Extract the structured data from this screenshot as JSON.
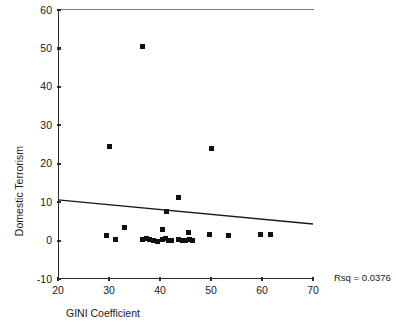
{
  "chart_data": {
    "type": "scatter",
    "title": "",
    "xlabel": "GINI Coefficient",
    "ylabel": "Domestic Terrorism",
    "xlim": [
      20,
      70
    ],
    "ylim": [
      -10,
      60
    ],
    "xticks": [
      20,
      30,
      40,
      50,
      60,
      70
    ],
    "yticks": [
      -10,
      0,
      10,
      20,
      30,
      40,
      50,
      60
    ],
    "grid": false,
    "legend": null,
    "annotations": [
      {
        "name": "rsq",
        "text": "Rsq = 0.0376",
        "value": 0.0376
      }
    ],
    "fit_line": {
      "type": "linear-regression",
      "x_start": 20,
      "y_start": 10.6,
      "x_end": 70,
      "y_end": 4.3
    },
    "points": [
      {
        "x": 36.5,
        "y": 50.6
      },
      {
        "x": 30.0,
        "y": 24.5
      },
      {
        "x": 50.0,
        "y": 24.0
      },
      {
        "x": 43.7,
        "y": 11.2
      },
      {
        "x": 41.3,
        "y": 7.5
      },
      {
        "x": 33.0,
        "y": 3.3
      },
      {
        "x": 40.5,
        "y": 3.0
      },
      {
        "x": 45.5,
        "y": 2.2
      },
      {
        "x": 29.6,
        "y": 1.4
      },
      {
        "x": 31.2,
        "y": 0.2
      },
      {
        "x": 36.5,
        "y": 0.4
      },
      {
        "x": 37.3,
        "y": 0.5
      },
      {
        "x": 38.0,
        "y": 0.3
      },
      {
        "x": 38.8,
        "y": 0.1
      },
      {
        "x": 39.6,
        "y": -0.2
      },
      {
        "x": 40.4,
        "y": 0.2
      },
      {
        "x": 41.0,
        "y": 0.5
      },
      {
        "x": 41.6,
        "y": 0.0
      },
      {
        "x": 42.2,
        "y": 0.1
      },
      {
        "x": 43.6,
        "y": 0.2
      },
      {
        "x": 44.4,
        "y": 0.0
      },
      {
        "x": 45.0,
        "y": -0.1
      },
      {
        "x": 45.8,
        "y": 0.3
      },
      {
        "x": 46.4,
        "y": -0.1
      },
      {
        "x": 49.8,
        "y": 1.6
      },
      {
        "x": 53.4,
        "y": 1.2
      },
      {
        "x": 59.8,
        "y": 1.5
      },
      {
        "x": 61.6,
        "y": 1.5
      }
    ]
  },
  "labels": {
    "xlabel": "GINI Coefficient",
    "ylabel": "Domestic Terrorism",
    "rsq": "Rsq = 0.0376"
  }
}
